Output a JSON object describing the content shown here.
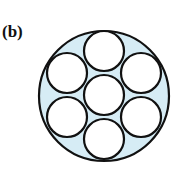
{
  "panel_label": "(b)",
  "diagram": {
    "outer_circle": {
      "cx": 104,
      "cy": 96,
      "r": 65,
      "fill": "#d6ecf5",
      "stroke": "#111111"
    },
    "inner_circles": [
      {
        "cx": 104,
        "cy": 95,
        "r": 20
      },
      {
        "cx": 104,
        "cy": 51,
        "r": 20
      },
      {
        "cx": 141,
        "cy": 73,
        "r": 20
      },
      {
        "cx": 141,
        "cy": 117,
        "r": 20
      },
      {
        "cx": 104,
        "cy": 139,
        "r": 20
      },
      {
        "cx": 67,
        "cy": 117,
        "r": 20
      },
      {
        "cx": 67,
        "cy": 73,
        "r": 20
      }
    ],
    "inner_fill": "#ffffff",
    "stroke": "#111111"
  }
}
